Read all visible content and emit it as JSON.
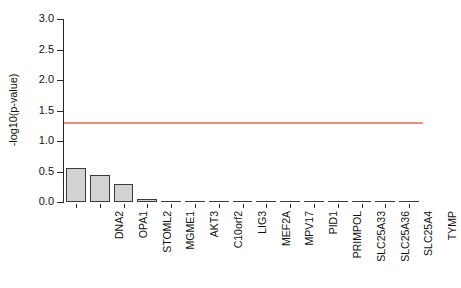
{
  "chart_data": {
    "type": "bar",
    "title": "",
    "subtitle": "",
    "xlabel": "",
    "ylabel": "-log10(p-value)",
    "categories": [
      "DNA2",
      "OPA1",
      "STOML2",
      "MGME1",
      "AKT3",
      "C10orf2",
      "LIG3",
      "MEF2A",
      "MPV17",
      "PID1",
      "PRIMPOL",
      "SLC25A33",
      "SLC25A36",
      "SLC25A4",
      "TYMP"
    ],
    "values": [
      0.55,
      0.44,
      0.29,
      0.05,
      0.0,
      0.0,
      0.0,
      0.0,
      0.0,
      0.0,
      0.0,
      0.0,
      0.0,
      0.0,
      0.0
    ],
    "ylim": [
      0.0,
      3.0
    ],
    "ytick_labels": [
      "0.0",
      "0.5",
      "1.0",
      "1.5",
      "2.0",
      "2.5",
      "3.0"
    ],
    "ytick_values": [
      0.0,
      0.5,
      1.0,
      1.5,
      2.0,
      2.5,
      3.0
    ],
    "grid": false,
    "legend": null,
    "annotations": [
      {
        "name": "significance-threshold",
        "type": "hline",
        "value": 1.3,
        "color": "#ef8e78"
      }
    ],
    "colors": {
      "bar_fill": "#d2d2d2",
      "bar_border": "#3b3b3b",
      "axis": "#262626",
      "threshold": "#ef8e78",
      "text": "#111111",
      "background": "#ffffff"
    }
  }
}
